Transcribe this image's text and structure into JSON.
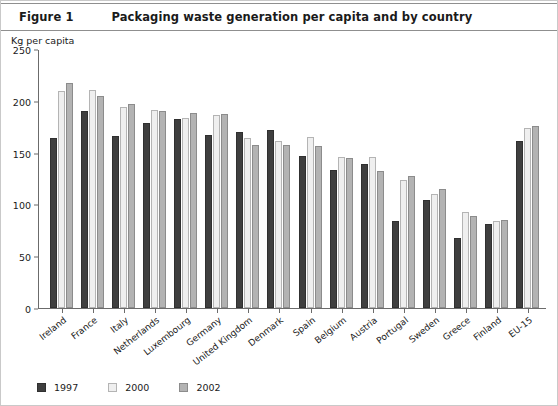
{
  "header": {
    "figure_label": "Figure 1",
    "title": "Packaging waste generation per capita and by country"
  },
  "chart_data": {
    "type": "bar",
    "title": "Packaging waste generation per capita and by country",
    "subtitle": "",
    "xlabel": "",
    "ylabel": "Kg per capita",
    "ylim": [
      0,
      250
    ],
    "yticks": [
      0,
      50,
      100,
      150,
      200,
      250
    ],
    "grid": false,
    "legend_position": "bottom-left",
    "categories": [
      "Ireland",
      "France",
      "Italy",
      "Netherlands",
      "Luxembourg",
      "Germany",
      "United Kingdom",
      "Denmark",
      "Spain",
      "Belgium",
      "Austria",
      "Portugal",
      "Sweden",
      "Greece",
      "Finland",
      "EU-15"
    ],
    "series": [
      {
        "name": "1997",
        "color": "#3f3f3f",
        "values": [
          164,
          190,
          166,
          179,
          182,
          167,
          170,
          172,
          147,
          133,
          139,
          84,
          104,
          68,
          81,
          161
        ]
      },
      {
        "name": "2000",
        "color": "#efefef",
        "values": [
          209,
          210,
          194,
          191,
          183,
          186,
          164,
          161,
          165,
          146,
          146,
          124,
          110,
          93,
          84,
          174
        ]
      },
      {
        "name": "2002",
        "color": "#b3b3b3",
        "values": [
          217,
          205,
          197,
          190,
          188,
          187,
          157,
          157,
          156,
          145,
          132,
          127,
          115,
          89,
          85,
          176
        ]
      }
    ]
  },
  "legend": {
    "items": [
      {
        "label": "1997",
        "swatch": "dark-square"
      },
      {
        "label": "2000",
        "swatch": "light-square"
      },
      {
        "label": "2002",
        "swatch": "gray-square"
      }
    ]
  }
}
